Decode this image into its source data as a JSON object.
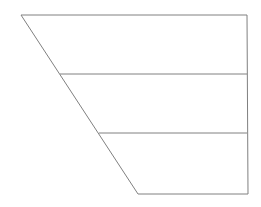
{
  "diagram": {
    "type": "tiered-trapezoid",
    "tiers": 3,
    "stroke_color": "#808080",
    "background": "#ffffff",
    "outline": {
      "top_left": [
        21,
        15
      ],
      "top_right": [
        247,
        15
      ],
      "bottom_right": [
        248,
        194
      ],
      "bottom_left": [
        138,
        194
      ]
    },
    "dividers": [
      {
        "y": 74,
        "x_start": 60,
        "x_end": 247
      },
      {
        "y": 133,
        "x_start": 99,
        "x_end": 247
      }
    ],
    "labels": []
  }
}
